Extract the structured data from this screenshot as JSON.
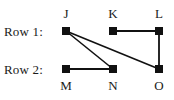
{
  "figure": {
    "background_color": "#ffffff",
    "ink_color": "#111111",
    "row_labels": [
      {
        "name": "row-1",
        "text": "Row 1:",
        "x": 4,
        "y": 24
      },
      {
        "name": "row-2",
        "text": "Row 2:",
        "x": 4,
        "y": 62
      }
    ],
    "nodes": [
      {
        "id": "J",
        "label": "J",
        "cx": 66,
        "cy": 31,
        "row": 1,
        "label_pos": "above",
        "label_x": 58,
        "label_y": 6
      },
      {
        "id": "K",
        "label": "K",
        "cx": 113,
        "cy": 31,
        "row": 1,
        "label_pos": "above",
        "label_x": 105,
        "label_y": 6
      },
      {
        "id": "L",
        "label": "L",
        "cx": 159,
        "cy": 31,
        "row": 1,
        "label_pos": "above",
        "label_x": 151,
        "label_y": 6
      },
      {
        "id": "M",
        "label": "M",
        "cx": 66,
        "cy": 69,
        "row": 2,
        "label_pos": "below",
        "label_x": 58,
        "label_y": 78
      },
      {
        "id": "N",
        "label": "N",
        "cx": 113,
        "cy": 69,
        "row": 2,
        "label_pos": "below",
        "label_x": 105,
        "label_y": 78
      },
      {
        "id": "O",
        "label": "O",
        "cx": 159,
        "cy": 69,
        "row": 2,
        "label_pos": "below",
        "label_x": 151,
        "label_y": 78
      }
    ],
    "edges": [
      {
        "from": "J",
        "to": "N",
        "x1": 66,
        "y1": 31,
        "x2": 113,
        "y2": 69
      },
      {
        "from": "J",
        "to": "O",
        "x1": 66,
        "y1": 31,
        "x2": 159,
        "y2": 69
      },
      {
        "from": "K",
        "to": "L",
        "x1": 113,
        "y1": 31,
        "x2": 159,
        "y2": 31
      },
      {
        "from": "L",
        "to": "O",
        "x1": 159,
        "y1": 31,
        "x2": 159,
        "y2": 69
      },
      {
        "from": "M",
        "to": "N",
        "x1": 66,
        "y1": 69,
        "x2": 113,
        "y2": 69
      }
    ]
  }
}
